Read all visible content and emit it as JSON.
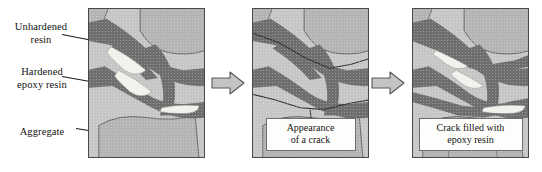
{
  "figure": {
    "background_color": "#ffffff"
  },
  "legend": {
    "items": [
      {
        "key": "unhardened",
        "label": "Unhardened\nresin",
        "target": "white resin pocket in panel 1"
      },
      {
        "key": "hardened",
        "label": "Hardened\nepoxy resin",
        "target": "dark epoxy vein in panel 1"
      },
      {
        "key": "aggregate",
        "label": "Aggregate",
        "target": "light speckled aggregate block in panel 1"
      }
    ]
  },
  "panels": [
    {
      "index": 1,
      "name": "panel-intact",
      "caption": "",
      "has_caption": false,
      "state": "intact composite: aggregate, hardened epoxy veins, unhardened resin pockets"
    },
    {
      "index": 2,
      "name": "panel-cracked",
      "caption": "Appearance\nof a crack",
      "has_caption": true,
      "state": "a crack has propagated through the matrix"
    },
    {
      "index": 3,
      "name": "panel-healed",
      "caption": "Crack filled with\nepoxy resin",
      "has_caption": true,
      "state": "crack sealed by released epoxy resin"
    }
  ],
  "arrows": [
    {
      "name": "flow-arrow-1",
      "direction": "right",
      "from_panel": 1,
      "to_panel": 2
    },
    {
      "name": "flow-arrow-2",
      "direction": "right",
      "from_panel": 2,
      "to_panel": 3
    }
  ],
  "colors": {
    "aggregate": "#b2b2b2",
    "matrix": "#c6c6c6",
    "hardened_epoxy": "#6e6e6e",
    "unhardened_resin": "#f2f1ec",
    "crack_line": "#3a3a3a",
    "outline": "#4a4a4a",
    "arrow_fill": "#c4c4c4",
    "arrow_outline": "#5a5a5a",
    "text": "#111111",
    "caption_background": "#fdfdfb"
  }
}
